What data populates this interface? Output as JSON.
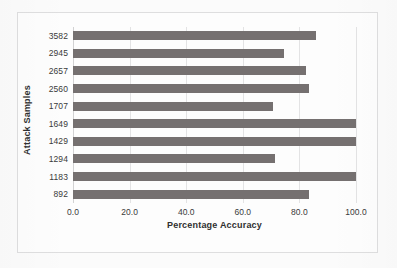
{
  "chart_data": {
    "type": "bar",
    "orientation": "horizontal",
    "title": "",
    "xlabel": "Percentage Accuracy",
    "ylabel": "Attack Samples",
    "categories": [
      "3582",
      "2945",
      "2657",
      "2560",
      "1707",
      "1649",
      "1429",
      "1294",
      "1183",
      "892"
    ],
    "values": [
      85.9,
      74.5,
      82.3,
      83.4,
      70.7,
      100.0,
      100.0,
      71.4,
      100.0,
      83.4
    ],
    "xlim": [
      0.0,
      100.0
    ],
    "xticks": [
      "0.0",
      "20.0",
      "40.0",
      "60.0",
      "80.0",
      "100.0"
    ],
    "xtick_values": [
      0,
      20,
      40,
      60,
      80,
      100
    ],
    "grid": "vertical",
    "legend": "none",
    "bar_color": "#757070",
    "gridline_color": "#e3e3e4",
    "frame_color": "#dededf",
    "background_color": "#fdfdfd"
  }
}
